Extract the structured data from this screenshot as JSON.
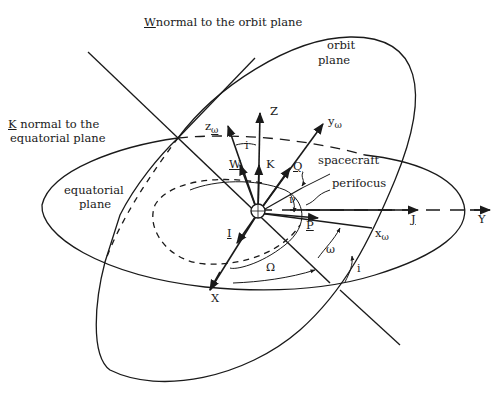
{
  "diagram": {
    "title_labels": {
      "w_normal": "normal to the orbit plane",
      "w_symbol": "W",
      "k_normal_line1": "normal to the",
      "k_symbol": "K",
      "k_normal_line2": "equatorial plane"
    },
    "plane_labels": {
      "orbit_line1": "orbit",
      "orbit_line2": "plane",
      "equatorial_line1": "equatorial",
      "equatorial_line2": "plane"
    },
    "axes": {
      "Z": "Z",
      "X": "X",
      "Y": "Y",
      "z_omega": "z",
      "y_omega": "y",
      "x_omega": "x",
      "omega_sub": "ω"
    },
    "unit_vectors": {
      "W": "W",
      "K": "K",
      "Q": "Q",
      "I": "I",
      "J": "J",
      "P": "P"
    },
    "angles": {
      "inclination_top": "i",
      "inclination_bottom": "i",
      "true_anomaly": "ν",
      "arg_perigee": "ω",
      "raan": "Ω"
    },
    "annotations": {
      "spacecraft": "spacecraft",
      "perifocus": "perifocus"
    },
    "colors": {
      "ink": "#1a1a1a",
      "background": "#ffffff"
    }
  }
}
